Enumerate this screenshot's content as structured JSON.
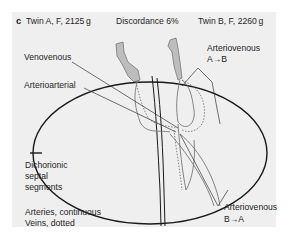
{
  "figure": {
    "panel_letter": "c",
    "header": {
      "twin_a": "Twin A, F, 2125 g",
      "discordance": "Discordance 6%",
      "twin_b": "Twin B, F, 2260 g"
    },
    "labels": {
      "venovenous": "Venovenous",
      "arterioarterial": "Arterioarterial",
      "arteriovenous_ab_line1": "Arteriovenous",
      "arteriovenous_ab_line2": "A→B",
      "arteriovenous_ba_line1": "Arteriovenous",
      "arteriovenous_ba_line2": "B→A"
    },
    "legend": {
      "septal_line1": "Dichorionic",
      "septal_line2": "septal",
      "septal_line3": "segments",
      "arteries": "Arteries, continuous",
      "veins": "Veins, dotted"
    },
    "colors": {
      "background": "#efefef",
      "outline": "#1a1a1a",
      "vessel": "#777777",
      "cord_fill": "#bdbdbd"
    }
  }
}
